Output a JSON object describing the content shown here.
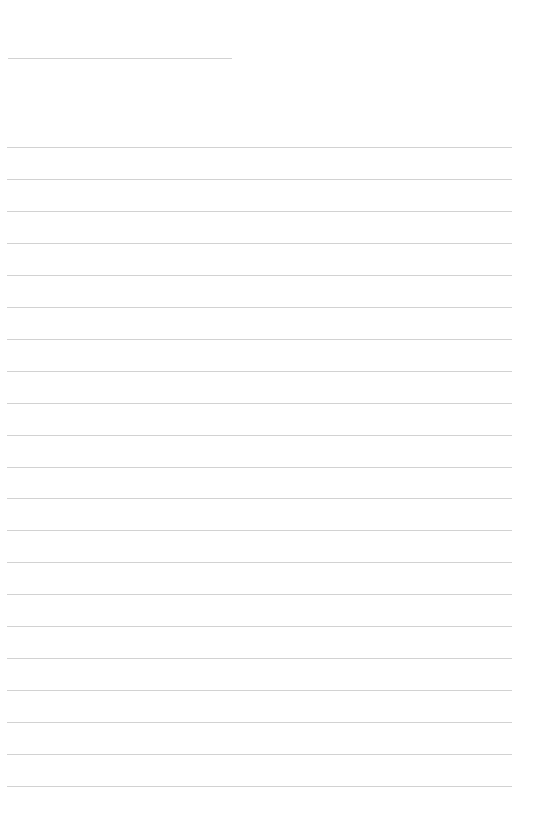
{
  "page": {
    "type": "lined-notebook-page",
    "background_color": "#ffffff",
    "line_color": "#d2d2d2",
    "header_line": {
      "x": 8,
      "y": 58,
      "width": 224
    },
    "ruled_lines": {
      "count": 21,
      "first_y": 147,
      "spacing": 31.95,
      "x": 7,
      "width": 505
    }
  }
}
